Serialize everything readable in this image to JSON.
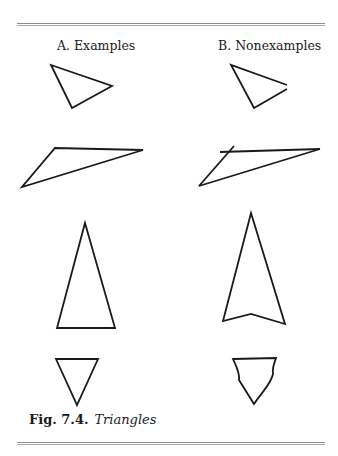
{
  "headings": {
    "examples": "A. Examples",
    "nonexamples": "B. Nonexamples"
  },
  "caption": {
    "number": "Fig. 7.4.",
    "title": "Triangles"
  },
  "colors": {
    "stroke": "#1a1a1a",
    "rule": "#8f8f8f"
  },
  "figures": {
    "examples": [
      {
        "id": "A1",
        "description": "scalene triangle"
      },
      {
        "id": "A2",
        "description": "obtuse triangle"
      },
      {
        "id": "A3",
        "description": "tall isosceles triangle"
      },
      {
        "id": "A4",
        "description": "inverted triangle"
      }
    ],
    "nonexamples": [
      {
        "id": "B1",
        "description": "open figure, sides not joined"
      },
      {
        "id": "B2",
        "description": "sides extend past vertex"
      },
      {
        "id": "B3",
        "description": "arrowhead with notched base (4 sides)"
      },
      {
        "id": "B4",
        "description": "curved sides"
      }
    ]
  }
}
